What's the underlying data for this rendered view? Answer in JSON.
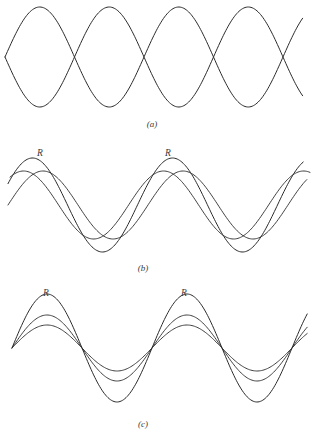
{
  "figure": {
    "type": "line-diagram",
    "title": "",
    "background_color": "#ffffff",
    "stroke_color": "#2b2b2b",
    "width": 317,
    "height": 435
  },
  "panels": [
    {
      "id": "a",
      "label": "(a)",
      "label_x": 152,
      "label_y": 127,
      "description": "Two equal sine waves 180 degrees out of phase forming a standing-wave envelope with four loops and five nodes.",
      "baseline_y": 57,
      "amplitude": 50,
      "wavelength": 139,
      "x_start": 5,
      "x_end": 303,
      "node_positions": [
        5,
        73,
        143,
        212,
        281
      ],
      "curves": [
        {
          "name": "wave-1",
          "phase_deg": 0,
          "amplitude": 50
        },
        {
          "name": "wave-2",
          "phase_deg": 180,
          "amplitude": 50
        }
      ],
      "r_labels": []
    },
    {
      "id": "b",
      "label": "(b)",
      "label_x": 143,
      "label_y": 271,
      "description": "Two component waves of equal amplitude with a phase difference, plus their resultant R of larger amplitude and intermediate phase.",
      "baseline_y": 205,
      "wavelength": 140,
      "x_start": 8,
      "x_end": 310,
      "curves": [
        {
          "name": "component-1",
          "phase_deg": 0,
          "amplitude": 34
        },
        {
          "name": "component-2",
          "phase_deg": 55,
          "amplitude": 34
        },
        {
          "name": "resultant-R",
          "phase_deg": 27,
          "amplitude": 47
        }
      ],
      "r_labels": [
        {
          "text": "R",
          "x": 40,
          "y": 156
        },
        {
          "text": "R",
          "x": 168,
          "y": 156
        }
      ]
    },
    {
      "id": "c",
      "label": "(c)",
      "label_x": 143,
      "label_y": 427,
      "description": "Two component waves in phase plus their resultant R, all sharing the same zero crossings; R has the largest amplitude.",
      "baseline_y": 348,
      "wavelength": 140,
      "x_start": 12,
      "x_end": 308,
      "node_positions": [
        12,
        85,
        155,
        225,
        295
      ],
      "curves": [
        {
          "name": "component-small",
          "phase_deg": 0,
          "amplitude": 23
        },
        {
          "name": "component-mid",
          "phase_deg": 0,
          "amplitude": 33
        },
        {
          "name": "resultant-R",
          "phase_deg": 0,
          "amplitude": 54
        }
      ],
      "r_labels": [
        {
          "text": "R",
          "x": 46,
          "y": 296
        },
        {
          "text": "R",
          "x": 184,
          "y": 296
        }
      ]
    }
  ],
  "chart_data": {
    "type": "line",
    "title": "",
    "xlabel": "",
    "ylabel": "",
    "grid": false,
    "legend": "none",
    "subplots": [
      {
        "panel": "a",
        "caption": "(a)",
        "series": [
          {
            "name": "wave-1",
            "amplitude": 1.0,
            "phase_deg": 0,
            "wavelength_px": 139
          },
          {
            "name": "wave-2",
            "amplitude": 1.0,
            "phase_deg": 180,
            "wavelength_px": 139
          }
        ],
        "annotations": []
      },
      {
        "panel": "b",
        "caption": "(b)",
        "series": [
          {
            "name": "component-1",
            "amplitude": 0.72,
            "phase_deg": 0,
            "wavelength_px": 140
          },
          {
            "name": "component-2",
            "amplitude": 0.72,
            "phase_deg": 55,
            "wavelength_px": 140
          },
          {
            "name": "R",
            "amplitude": 1.0,
            "phase_deg": 27,
            "wavelength_px": 140
          }
        ],
        "annotations": [
          "R",
          "R"
        ]
      },
      {
        "panel": "c",
        "caption": "(c)",
        "series": [
          {
            "name": "component-small",
            "amplitude": 0.43,
            "phase_deg": 0,
            "wavelength_px": 140
          },
          {
            "name": "component-mid",
            "amplitude": 0.61,
            "phase_deg": 0,
            "wavelength_px": 140
          },
          {
            "name": "R",
            "amplitude": 1.0,
            "phase_deg": 0,
            "wavelength_px": 140
          }
        ],
        "annotations": [
          "R",
          "R"
        ]
      }
    ]
  }
}
